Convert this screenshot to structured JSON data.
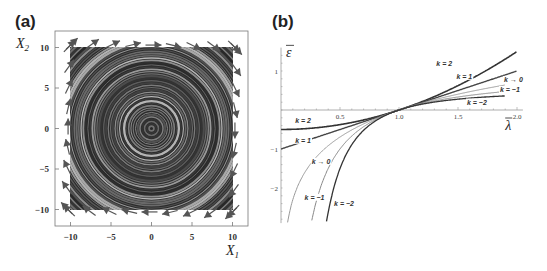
{
  "panels": {
    "a": {
      "label": "(a)"
    },
    "b": {
      "label": "(b)"
    }
  },
  "chart_data": [
    {
      "type": "scatter",
      "subtype": "stream/vector field",
      "title": "",
      "panel": "(a)",
      "xlabel": "X1",
      "ylabel": "X2",
      "xlim": [
        -12,
        12
      ],
      "ylim": [
        -12,
        12
      ],
      "xticks": [
        -10,
        -5,
        0,
        5,
        10
      ],
      "yticks": [
        -10,
        -5,
        0,
        5,
        10
      ],
      "xtick_labels": [
        "−10",
        "−5",
        "0",
        "5",
        "10"
      ],
      "ytick_labels": [
        "−10",
        "−5",
        "0",
        "5",
        "10"
      ],
      "description": "Concentric circular streamlines centered at origin over [-10,10]x[-10,10], with clockwise vector arrows along the border",
      "field": {
        "u": "X2",
        "v": "-X1",
        "center": [
          0,
          0
        ],
        "rotation": "clockwise"
      },
      "colors": {
        "stream_dark": "#2a2a2a",
        "stream_light": "#b0b0b0",
        "arrow": "#555555"
      }
    },
    {
      "type": "line",
      "panel": "(b)",
      "title": "",
      "xlabel": "λ̄",
      "ylabel": "ε̄",
      "xlim": [
        0,
        2.05
      ],
      "ylim": [
        -2.9,
        1.6
      ],
      "xticks": [
        0.5,
        1.0,
        1.5,
        2.0
      ],
      "xtick_labels": [
        "0.5",
        "1.0",
        "1.5",
        "2.0"
      ],
      "yticks": [
        1,
        -1,
        -2
      ],
      "ytick_labels": [
        "1",
        "−1",
        "−2"
      ],
      "formula": "ε = (λ^k − 1)/k ; k→0 gives ln λ",
      "series": [
        {
          "name": "k = 2",
          "k": 2,
          "label": "k = 2",
          "color": "#333333",
          "width": 1.6,
          "x": [
            0,
            0.25,
            0.5,
            0.75,
            1.0,
            1.25,
            1.5,
            1.75,
            2.0
          ],
          "y": [
            -0.5,
            -0.469,
            -0.375,
            -0.219,
            0,
            0.281,
            0.625,
            1.031,
            1.5
          ]
        },
        {
          "name": "k = 1",
          "k": 1,
          "label": "k = 1",
          "color": "#444444",
          "width": 1.4,
          "x": [
            0,
            0.25,
            0.5,
            0.75,
            1.0,
            1.25,
            1.5,
            1.75,
            2.0
          ],
          "y": [
            -1,
            -0.75,
            -0.5,
            -0.25,
            0,
            0.25,
            0.5,
            0.75,
            1.0
          ]
        },
        {
          "name": "k → 0",
          "k": 0,
          "label": "k → 0",
          "color": "#999999",
          "width": 1.0,
          "x": [
            0.05,
            0.1,
            0.25,
            0.5,
            0.75,
            1.0,
            1.25,
            1.5,
            1.75,
            1.9
          ],
          "y": [
            -2.996,
            -2.303,
            -1.386,
            -0.693,
            -0.288,
            0,
            0.223,
            0.405,
            0.56,
            0.642
          ]
        },
        {
          "name": "k = −1",
          "k": -1,
          "label": "k = −1",
          "color": "#888888",
          "width": 1.0,
          "x": [
            0.26,
            0.3,
            0.4,
            0.5,
            0.75,
            1.0,
            1.25,
            1.5,
            1.75,
            1.9
          ],
          "y": [
            -2.846,
            -2.333,
            -1.5,
            -1.0,
            -0.333,
            0,
            0.2,
            0.333,
            0.429,
            0.474
          ]
        },
        {
          "name": "k = −2",
          "k": -2,
          "label": "k = −2",
          "color": "#333333",
          "width": 1.3,
          "x": [
            0.385,
            0.4,
            0.5,
            0.6,
            0.75,
            1.0,
            1.25,
            1.5,
            1.75,
            1.9
          ],
          "y": [
            -2.873,
            -2.625,
            -1.5,
            -0.889,
            -0.389,
            0,
            0.18,
            0.278,
            0.337,
            0.361
          ]
        }
      ],
      "annotations": [
        {
          "text": "k = 2",
          "near": "upper-right end of k=2"
        },
        {
          "text": "k = 1",
          "near": "upper-right end of k=1"
        },
        {
          "text": "k → 0",
          "near": "right end of k→0"
        },
        {
          "text": "k = −1",
          "near": "right end of k=−1"
        },
        {
          "text": "k = −2",
          "near": "right end of k=−2"
        },
        {
          "text": "k = 2",
          "near": "left start of k=2"
        },
        {
          "text": "k = 1",
          "near": "left start of k=1"
        },
        {
          "text": "k → 0",
          "near": "lower-left of k→0"
        },
        {
          "text": "k = −1",
          "near": "lower-left of k=−1"
        },
        {
          "text": "k = −2",
          "near": "lower-left of k=−2"
        }
      ]
    }
  ]
}
